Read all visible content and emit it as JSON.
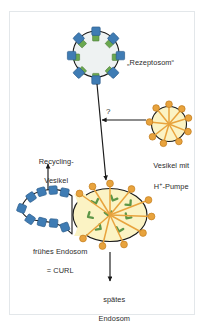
{
  "figure": {
    "title_internal": "endocytosis-pathway-diagram",
    "background_color": "#ffffff",
    "frame_border_color": "#e3e7ea"
  },
  "labels": {
    "rezeptosom": "„Rezeptosom“",
    "vesikel_mit": "Vesikel mit",
    "h_pumpe_pre": "H",
    "h_pumpe_sup": "+",
    "h_pumpe_post": "-Pumpe",
    "recycling_line1": "Recycling-",
    "recycling_line2": "Vesikel",
    "endosom_line1": "frühes Endosom",
    "endosom_line2": "= CURL",
    "spaetes_line1": "spätes",
    "spaetes_line2": "Endosom",
    "question_mark": "?"
  },
  "colors": {
    "receptor_blue_fill": "#3f7cb4",
    "receptor_blue_stroke": "#2e5f8e",
    "receptor_blue_light": "#5b95c7",
    "cargo_green_fill": "#6aa84f",
    "cargo_green_stroke": "#4e7c3a",
    "pump_orange_fill": "#e8a33d",
    "pump_orange_stroke": "#c47f21",
    "vesicle_yellow_fill": "#fbf3c4",
    "receptosome_fill": "#eef2f2",
    "membrane_stroke": "#1a1a1a",
    "arrow_stroke": "#1a1a1a",
    "text_color": "#2c2c2c"
  },
  "structures": {
    "receptosome": {
      "name": "Rezeptosom vesicle",
      "center_x": 96,
      "center_y": 54,
      "radius": 23,
      "receptor_count": 8,
      "fill": "#eef2f2"
    },
    "proton_pump_vesicle": {
      "name": "Vesikel mit H+-Pumpe",
      "center_x": 169,
      "center_y": 125,
      "radius": 18,
      "pump_count": 9,
      "fill": "#fbf3c4"
    },
    "early_endosome": {
      "name": "frühes Endosom = CURL",
      "center_x": 109,
      "center_y": 216,
      "radius_x": 37,
      "radius_y": 27,
      "pump_count": 10,
      "cargo_count": 8,
      "fill": "#fbf3c4"
    },
    "recycling_tubule": {
      "name": "Recycling-Vesikel tubule",
      "receptor_count_upper": 4,
      "receptor_count_lower": 4,
      "tip_receptor": 1
    }
  },
  "arrows": [
    {
      "name": "receptosome-to-endosome",
      "direction": "down",
      "from_x": 96,
      "from_y": 80,
      "to_x": 106,
      "to_y": 182
    },
    {
      "name": "pump-vesicle-to-pathway",
      "direction": "left",
      "from_x": 148,
      "from_y": 120,
      "to_x": 100,
      "to_y": 120
    },
    {
      "name": "tubule-to-recycling",
      "direction": "up",
      "from_x": 48,
      "from_y": 196,
      "to_x": 48,
      "to_y": 166
    },
    {
      "name": "endosome-to-late-endosome",
      "direction": "down",
      "from_x": 109,
      "from_y": 250,
      "to_x": 109,
      "to_y": 281
    }
  ]
}
